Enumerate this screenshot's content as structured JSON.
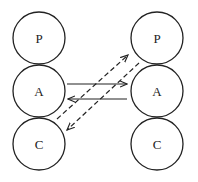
{
  "diagram": {
    "left_column": {
      "nodes": [
        {
          "label": "P",
          "cx": 39,
          "cy": 38
        },
        {
          "label": "A",
          "cx": 39,
          "cy": 91
        },
        {
          "label": "C",
          "cx": 39,
          "cy": 144
        }
      ]
    },
    "right_column": {
      "nodes": [
        {
          "label": "P",
          "cx": 157,
          "cy": 38
        },
        {
          "label": "A",
          "cx": 157,
          "cy": 91
        },
        {
          "label": "C",
          "cx": 157,
          "cy": 144
        }
      ]
    },
    "radius": 26,
    "edges": [
      {
        "from": "left.A",
        "to": "right.A",
        "style": "solid"
      },
      {
        "from": "right.A",
        "to": "left.A",
        "style": "solid"
      },
      {
        "from": "left.C",
        "to": "right.P",
        "style": "dashed"
      },
      {
        "from": "right.P",
        "to": "left.C",
        "style": "dashed"
      }
    ]
  }
}
